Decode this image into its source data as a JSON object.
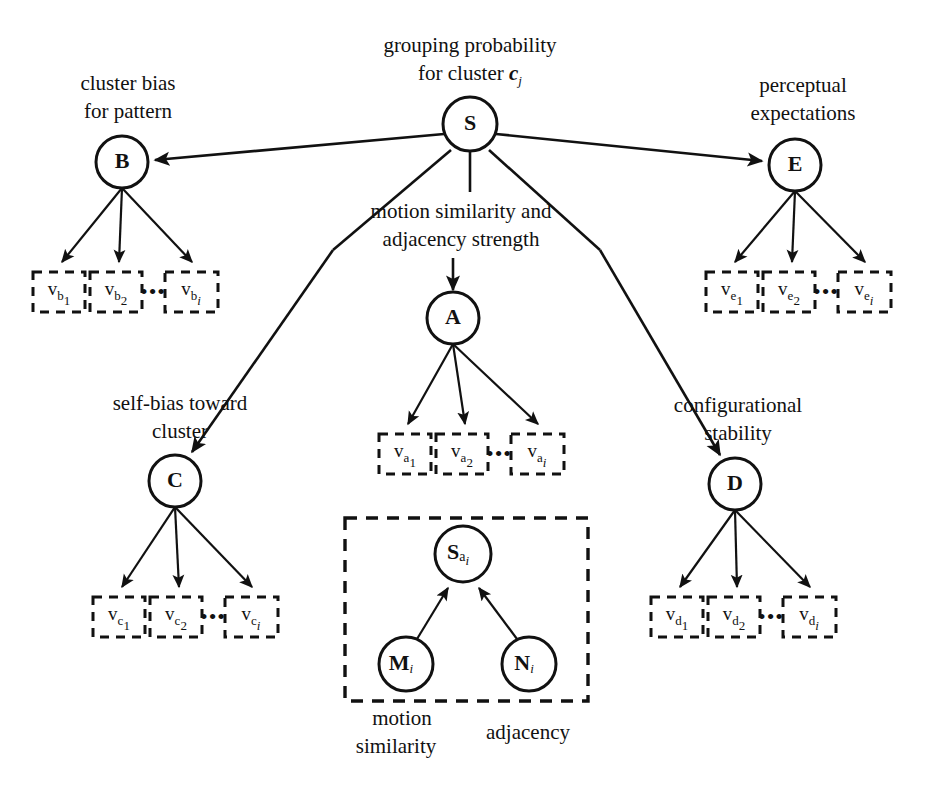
{
  "diagram": {
    "title_visible": false,
    "colors": {
      "stroke": "#111111",
      "background": "#ffffff"
    },
    "nodes": [
      {
        "id": "S",
        "label": "S",
        "cx": 470,
        "cy": 124,
        "r": 27
      },
      {
        "id": "B",
        "label": "B",
        "cx": 122,
        "cy": 162,
        "r": 26
      },
      {
        "id": "E",
        "label": "E",
        "cx": 795,
        "cy": 165,
        "r": 26
      },
      {
        "id": "A",
        "label": "A",
        "cx": 453,
        "cy": 318,
        "r": 26
      },
      {
        "id": "C",
        "label": "C",
        "cx": 175,
        "cy": 481,
        "r": 26
      },
      {
        "id": "D",
        "label": "D",
        "cx": 735,
        "cy": 484,
        "r": 26
      },
      {
        "id": "Sa",
        "label": "S",
        "sub": "a",
        "subsub": "i",
        "cx": 463,
        "cy": 554,
        "r": 28
      },
      {
        "id": "M",
        "label": "M",
        "sub_italic": "i",
        "cx": 406,
        "cy": 664,
        "r": 27
      },
      {
        "id": "N",
        "label": "N",
        "sub_italic": "i",
        "cx": 529,
        "cy": 664,
        "r": 27
      }
    ],
    "annotations": [
      {
        "id": "grouping",
        "lines": [
          "grouping probability",
          "for cluster"
        ],
        "italic_tail": "c",
        "italic_sub": "j",
        "x": 470,
        "y": 44
      },
      {
        "id": "cluster-bias",
        "lines": [
          "cluster bias",
          "for pattern"
        ],
        "x": 128,
        "y": 82
      },
      {
        "id": "perceptual",
        "lines": [
          "perceptual",
          "expectations"
        ],
        "x": 803,
        "y": 84
      },
      {
        "id": "motion-adjacency",
        "lines": [
          "motion similarity and",
          "adjacency strength"
        ],
        "x": 461,
        "y": 213
      },
      {
        "id": "self-bias",
        "lines": [
          "self-bias toward",
          "cluster"
        ],
        "x": 180,
        "y": 404
      },
      {
        "id": "config-stability",
        "lines": [
          "configurational",
          "stability"
        ],
        "x": 735,
        "y": 406
      },
      {
        "id": "motion-similarity",
        "lines": [
          "motion",
          "similarity"
        ],
        "x": 402,
        "y": 720
      },
      {
        "id": "adjacency",
        "lines": [
          "adjacency"
        ],
        "x": 525,
        "y": 734
      }
    ],
    "leaf_groups": [
      {
        "id": "b-leaves",
        "parent": "B",
        "y": 272,
        "items": [
          {
            "base": "v",
            "sub": "b",
            "subsub": "1",
            "x": 33
          },
          {
            "base": "v",
            "sub": "b",
            "subsub": "2",
            "x": 90
          },
          {
            "base": "v",
            "sub": "b",
            "subsub": "i",
            "italic_subsub": true,
            "x": 165
          }
        ],
        "ellipsis": "•••",
        "ellipsis_x": 152
      },
      {
        "id": "e-leaves",
        "parent": "E",
        "y": 272,
        "items": [
          {
            "base": "v",
            "sub": "e",
            "subsub": "1",
            "x": 706
          },
          {
            "base": "v",
            "sub": "e",
            "subsub": "2",
            "x": 763
          },
          {
            "base": "v",
            "sub": "e",
            "subsub": "i",
            "italic_subsub": true,
            "x": 838
          }
        ],
        "ellipsis": "•••",
        "ellipsis_x": 825
      },
      {
        "id": "a-leaves",
        "parent": "A",
        "y": 434,
        "items": [
          {
            "base": "v",
            "sub": "a",
            "subsub": "1",
            "x": 379
          },
          {
            "base": "v",
            "sub": "a",
            "subsub": "2",
            "x": 436
          },
          {
            "base": "v",
            "sub": "a",
            "subsub": "i",
            "italic_subsub": true,
            "x": 511
          }
        ],
        "ellipsis": "•••",
        "ellipsis_x": 498
      },
      {
        "id": "c-leaves",
        "parent": "C",
        "y": 597,
        "items": [
          {
            "base": "v",
            "sub": "c",
            "subsub": "1",
            "x": 93
          },
          {
            "base": "v",
            "sub": "c",
            "subsub": "2",
            "x": 150
          },
          {
            "base": "v",
            "sub": "c",
            "subsub": "i",
            "italic_subsub": true,
            "x": 225
          }
        ],
        "ellipsis": "•••",
        "ellipsis_x": 212
      },
      {
        "id": "d-leaves",
        "parent": "D",
        "y": 597,
        "items": [
          {
            "base": "v",
            "sub": "d",
            "subsub": "1",
            "x": 651
          },
          {
            "base": "v",
            "sub": "d",
            "subsub": "2",
            "x": 708
          },
          {
            "base": "v",
            "sub": "d",
            "subsub": "i",
            "italic_subsub": true,
            "x": 783
          }
        ],
        "ellipsis": "•••",
        "ellipsis_x": 770
      }
    ],
    "group_box": {
      "id": "similarity-unit-box",
      "x": 345,
      "y": 518,
      "width": 243,
      "height": 183
    },
    "edges": [
      {
        "from": "S",
        "to": "B",
        "arrow": true
      },
      {
        "from": "S",
        "to": "E",
        "arrow": true
      },
      {
        "from": "S",
        "to": "C",
        "arrow": true
      },
      {
        "from": "S",
        "to": "A",
        "arrow": true
      },
      {
        "from": "S",
        "to": "D",
        "arrow": true
      },
      {
        "from": "B",
        "to": "v_b_1",
        "arrow": true
      },
      {
        "from": "B",
        "to": "v_b_2",
        "arrow": true
      },
      {
        "from": "B",
        "to": "v_b_i",
        "arrow": true
      },
      {
        "from": "E",
        "to": "v_e_1",
        "arrow": true
      },
      {
        "from": "E",
        "to": "v_e_2",
        "arrow": true
      },
      {
        "from": "E",
        "to": "v_e_i",
        "arrow": true
      },
      {
        "from": "A",
        "to": "v_a_1",
        "arrow": true
      },
      {
        "from": "A",
        "to": "v_a_2",
        "arrow": true
      },
      {
        "from": "A",
        "to": "v_a_i",
        "arrow": true
      },
      {
        "from": "C",
        "to": "v_c_1",
        "arrow": true
      },
      {
        "from": "C",
        "to": "v_c_2",
        "arrow": true
      },
      {
        "from": "C",
        "to": "v_c_i",
        "arrow": true
      },
      {
        "from": "D",
        "to": "v_d_1",
        "arrow": true
      },
      {
        "from": "D",
        "to": "v_d_2",
        "arrow": true
      },
      {
        "from": "D",
        "to": "v_d_i",
        "arrow": true
      },
      {
        "from": "M",
        "to": "Sa",
        "arrow": true
      },
      {
        "from": "N",
        "to": "Sa",
        "arrow": true
      }
    ]
  }
}
